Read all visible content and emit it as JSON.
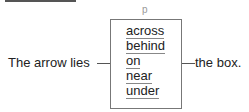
{
  "diagram": {
    "slot_label": "p",
    "sentence_start": "The arrow lies",
    "sentence_end": "the box.",
    "options": [
      {
        "label": "across"
      },
      {
        "label": "behind"
      },
      {
        "label": "on"
      },
      {
        "label": "near"
      },
      {
        "label": "under"
      }
    ]
  }
}
